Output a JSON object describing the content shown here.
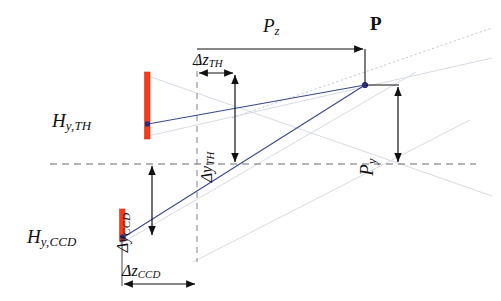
{
  "figure": {
    "type": "optical-geometry-diagram",
    "background_color": "#ffffff",
    "ray_color": "#3b4a8c",
    "marker_color": "#2b2f7a",
    "sensor_color": "#f93a1a",
    "axis_color": "#6d6d6d",
    "faint_ray_color": "#d9dde6",
    "annotation_color": "#111111"
  },
  "labels": {
    "p_point": "P",
    "p_z": "P",
    "p_z_sub": "z",
    "p_y": "P",
    "p_y_sub": "y",
    "delta_z_th": "Δz",
    "delta_z_th_sub": "TH",
    "delta_y_th": "Δy",
    "delta_y_th_sub": "TH",
    "delta_y_ccd": "Δy",
    "delta_y_ccd_sub": "CCD",
    "delta_z_ccd": "Δz",
    "delta_z_ccd_sub": "CCD",
    "h_y_th": "H",
    "h_y_th_sub": "y,TH",
    "h_y_ccd": "H",
    "h_y_ccd_sub": "y,CCD"
  },
  "geometry": {
    "horizontal_axis_y": 164,
    "horizontal_axis_x1": 50,
    "horizontal_axis_x2": 476,
    "vertical_axis_x": 197,
    "vertical_axis_y1": 60,
    "vertical_axis_y2": 262,
    "point_p": {
      "x": 365,
      "y": 85
    },
    "point_th": {
      "x": 148,
      "y": 124
    },
    "point_ccd": {
      "x": 124,
      "y": 237
    },
    "sensor_th": {
      "x": 147,
      "y_top": 72,
      "y_bottom": 139,
      "width": 5
    },
    "sensor_ccd": {
      "x": 122,
      "y_top": 209,
      "y_bottom": 241,
      "width": 5
    },
    "pz_arrow": {
      "x1": 197,
      "x2": 366,
      "y": 49
    },
    "dz_th_arrow": {
      "x1": 197,
      "x2": 235,
      "y": 73
    },
    "dy_th_arrow": {
      "x": 235,
      "y1": 73,
      "y2": 164
    },
    "py_arrow": {
      "x": 398,
      "y1": 85,
      "y2": 164
    },
    "dy_ccd_arrow": {
      "x": 152,
      "y1": 164,
      "y2": 237
    },
    "dz_ccd_arrow": {
      "x1": 122,
      "x2": 197,
      "y": 284
    }
  }
}
